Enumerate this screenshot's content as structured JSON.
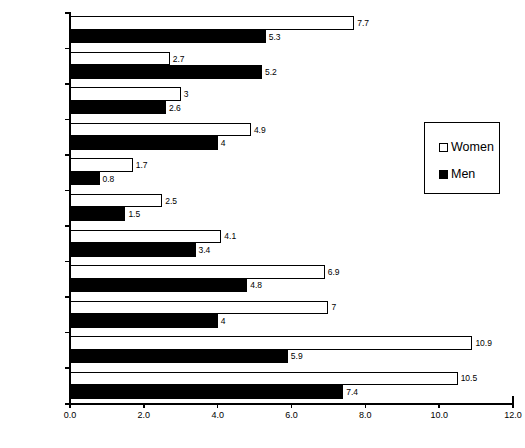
{
  "chart_data": {
    "type": "bar",
    "orientation": "horizontal",
    "title": "",
    "subtitle": "",
    "xlabel": "",
    "ylabel": "",
    "xlim": [
      0.0,
      12.0
    ],
    "xticks": [
      0.0,
      2.0,
      4.0,
      6.0,
      8.0,
      10.0,
      12.0
    ],
    "xtick_labels": [
      "0.0",
      "2.0",
      "4.0",
      "6.0",
      "8.0",
      "10.0",
      "12.0"
    ],
    "grid": false,
    "legend_position": "upper-right",
    "categories": [
      "Lt Hswrk",
      "Using Phone",
      "Mng Money",
      "Meal Prep",
      "Eating",
      "Toileting",
      "Dressing",
      "Transfer",
      "Bathing",
      "Getting Out",
      "Walking"
    ],
    "series": [
      {
        "name": "Women",
        "color": "#ffffff",
        "edge_color": "#000000",
        "values": [
          7.7,
          2.7,
          3,
          4.9,
          1.7,
          2.5,
          4.1,
          6.9,
          7,
          10.9,
          10.5
        ],
        "value_labels": [
          "7.7",
          "2.7",
          "3",
          "4.9",
          "1.7",
          "2.5",
          "4.1",
          "6.9",
          "7",
          "10.9",
          "10.5"
        ]
      },
      {
        "name": "Men",
        "color": "#000000",
        "edge_color": "#000000",
        "values": [
          5.3,
          5.2,
          2.6,
          4,
          0.8,
          1.5,
          3.4,
          4.8,
          4,
          5.9,
          7.4
        ],
        "value_labels": [
          "5.3",
          "5.2",
          "2.6",
          "4",
          "0.8",
          "1.5",
          "3.4",
          "4.8",
          "4",
          "5.9",
          "7.4"
        ]
      }
    ]
  },
  "legend": {
    "entries": [
      {
        "label": "Women",
        "swatch": "white-square-icon"
      },
      {
        "label": "Men",
        "swatch": "black-square-icon"
      }
    ]
  }
}
